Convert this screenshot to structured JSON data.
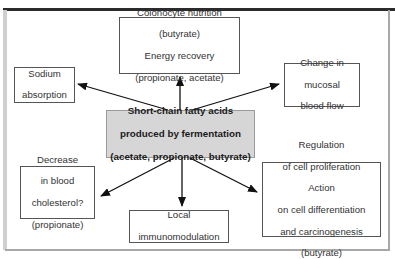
{
  "diagram": {
    "central": {
      "line1": "Short-chain fatty acids",
      "line2": "produced by fermentation",
      "line3": "(acetate, propionate, butyrate)"
    },
    "effects": {
      "top": {
        "line1": "Colonocyte nutrition",
        "line2": "(butyrate)",
        "line3": "Energy recovery",
        "line4": "(propionate, acetate)"
      },
      "left_upper": {
        "line1": "Sodium",
        "line2": "absorption"
      },
      "right_upper": {
        "line1": "Change in",
        "line2": "mucosal",
        "line3": "blood flow"
      },
      "left_lower": {
        "line1": "Decrease",
        "line2": "in blood",
        "line3": "cholesterol?",
        "line4": "(propionate)"
      },
      "bottom": {
        "line1": "Local",
        "line2": "immunomodulation"
      },
      "right_lower": {
        "line1": "Regulation",
        "line2": "of cell proliferation",
        "line3": "Action",
        "line4": "on cell differentiation",
        "line5": "and carcinogenesis",
        "line6": "(butyrate)"
      }
    },
    "colors": {
      "central_fill": "#d6d6d6",
      "box_border": "#555555",
      "arrow": "#111111",
      "top_rule": "#2b2b2b"
    }
  }
}
